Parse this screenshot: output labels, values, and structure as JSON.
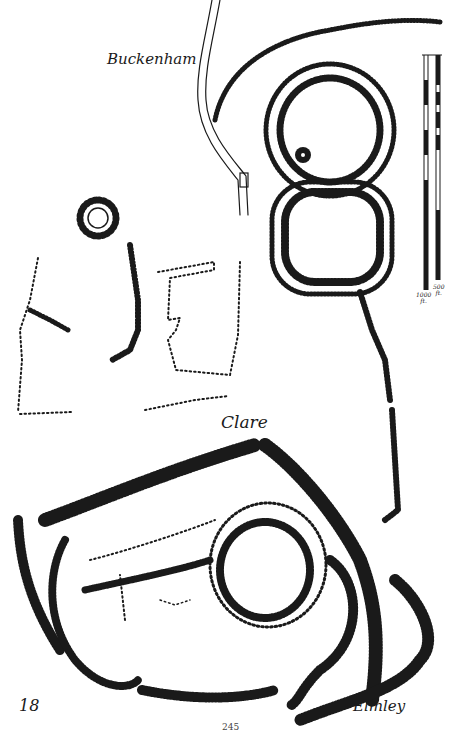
{
  "plate": {
    "figure_number": "18",
    "page_number": "245"
  },
  "sites": [
    {
      "name": "Buckenham",
      "position": "top-left"
    },
    {
      "name": "Clare",
      "position": "middle"
    },
    {
      "name": "Elmley",
      "position": "bottom-right"
    }
  ],
  "scale_bars": [
    {
      "label": "1000 ft.",
      "label_line1": "1000",
      "label_line2": "ft."
    },
    {
      "label": "500 ft.",
      "label_line1": "500",
      "label_line2": "ft."
    }
  ],
  "colors": {
    "ink": "#1a1a1a",
    "paper": "#ffffff"
  }
}
